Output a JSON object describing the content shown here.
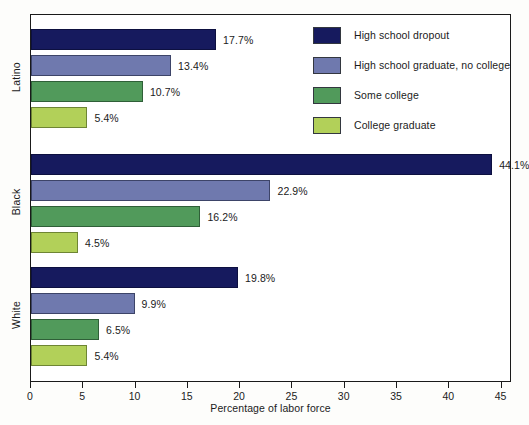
{
  "chart_data": {
    "type": "bar",
    "orientation": "horizontal",
    "title": "",
    "xlabel": "Percentage of labor force",
    "ylabel": "",
    "xlim": [
      0,
      46
    ],
    "xticks": [
      0,
      5,
      10,
      15,
      20,
      25,
      30,
      35,
      40,
      45
    ],
    "xtick_labels": [
      "0",
      "5",
      "10",
      "15",
      "20",
      "25",
      "30",
      "35",
      "40",
      "45"
    ],
    "grid": false,
    "legend_position": "top-right",
    "categories": [
      "Latino",
      "Black",
      "White"
    ],
    "series": [
      {
        "name": "High school dropout",
        "color": "#161a5e",
        "values": [
          17.7,
          44.1,
          19.8
        ]
      },
      {
        "name": "High school graduate, no college",
        "color": "#6f79ae",
        "values": [
          13.4,
          22.9,
          9.9
        ]
      },
      {
        "name": "Some college",
        "color": "#519a5b",
        "values": [
          16.2,
          16.2,
          6.5
        ]
      },
      {
        "name": "College graduate",
        "color": "#b2d059",
        "values": [
          5.4,
          4.5,
          5.4
        ]
      }
    ],
    "bars": [
      {
        "group": "Latino",
        "series": "High school dropout",
        "value": 17.7,
        "label": "17.7%",
        "color": "#161a5e"
      },
      {
        "group": "Latino",
        "series": "High school graduate, no college",
        "value": 13.4,
        "label": "13.4%",
        "color": "#6f79ae"
      },
      {
        "group": "Latino",
        "series": "Some college",
        "value": 10.7,
        "label": "10.7%",
        "color": "#519a5b"
      },
      {
        "group": "Latino",
        "series": "College graduate",
        "value": 5.4,
        "label": "5.4%",
        "color": "#b2d059"
      },
      {
        "group": "Black",
        "series": "High school dropout",
        "value": 44.1,
        "label": "44.1%",
        "color": "#161a5e"
      },
      {
        "group": "Black",
        "series": "High school graduate, no college",
        "value": 22.9,
        "label": "22.9%",
        "color": "#6f79ae"
      },
      {
        "group": "Black",
        "series": "Some college",
        "value": 16.2,
        "label": "16.2%",
        "color": "#519a5b"
      },
      {
        "group": "Black",
        "series": "College graduate",
        "value": 4.5,
        "label": "4.5%",
        "color": "#b2d059"
      },
      {
        "group": "White",
        "series": "High school dropout",
        "value": 19.8,
        "label": "19.8%",
        "color": "#161a5e"
      },
      {
        "group": "White",
        "series": "High school graduate, no college",
        "value": 9.9,
        "label": "9.9%",
        "color": "#6f79ae"
      },
      {
        "group": "White",
        "series": "Some college",
        "value": 6.5,
        "label": "6.5%",
        "color": "#519a5b"
      },
      {
        "group": "White",
        "series": "College graduate",
        "value": 5.4,
        "label": "5.4%",
        "color": "#b2d059"
      }
    ],
    "legend": [
      {
        "label": "High school dropout",
        "color": "#161a5e"
      },
      {
        "label": "High school graduate, no college",
        "color": "#6f79ae"
      },
      {
        "label": "Some college",
        "color": "#519a5b"
      },
      {
        "label": "College graduate",
        "color": "#b2d059"
      }
    ]
  }
}
